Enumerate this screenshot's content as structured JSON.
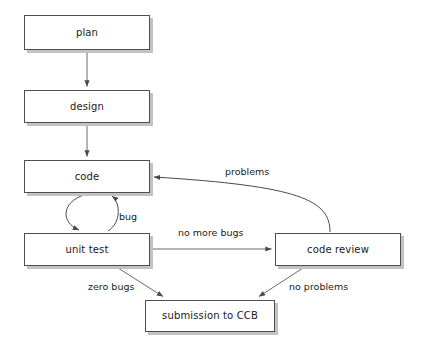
{
  "diagram": {
    "background_color": "#ffffff",
    "box_border_color": "#4f4f4f",
    "box_shadow_color": "#c2c2c2",
    "line_color": "#555555",
    "text_color": "#1a1a1a",
    "nodes": [
      {
        "id": "plan",
        "label": "plan",
        "x": 24,
        "y": 15,
        "w": 126,
        "h": 35
      },
      {
        "id": "design",
        "label": "design",
        "x": 24,
        "y": 90,
        "w": 126,
        "h": 33
      },
      {
        "id": "code",
        "label": "code",
        "x": 24,
        "y": 160,
        "w": 126,
        "h": 33
      },
      {
        "id": "unit_test",
        "label": "unit test",
        "x": 24,
        "y": 233,
        "w": 126,
        "h": 33
      },
      {
        "id": "code_review",
        "label": "code review",
        "x": 275,
        "y": 233,
        "w": 126,
        "h": 33
      },
      {
        "id": "submission",
        "label": "submission to CCB",
        "x": 145,
        "y": 300,
        "w": 130,
        "h": 32
      }
    ],
    "edges": [
      {
        "from": "plan",
        "to": "design",
        "label": ""
      },
      {
        "from": "design",
        "to": "code",
        "label": ""
      },
      {
        "from": "code",
        "to": "unit_test",
        "label": "bug",
        "style": "loop-left"
      },
      {
        "from": "unit_test",
        "to": "code",
        "label": "bug",
        "style": "loop-right"
      },
      {
        "from": "unit_test",
        "to": "code_review",
        "label": "no more bugs"
      },
      {
        "from": "code_review",
        "to": "code",
        "label": "problems",
        "style": "curved"
      },
      {
        "from": "unit_test",
        "to": "submission",
        "label": "zero bugs"
      },
      {
        "from": "code_review",
        "to": "submission",
        "label": "no problems"
      }
    ],
    "edge_labels": [
      {
        "id": "bug",
        "text": "bug",
        "x": 119,
        "y": 212
      },
      {
        "id": "problems",
        "text": "problems",
        "x": 225,
        "y": 167
      },
      {
        "id": "no_more_bugs",
        "text": "no more bugs",
        "x": 178,
        "y": 228
      },
      {
        "id": "zero_bugs",
        "text": "zero bugs",
        "x": 88,
        "y": 282
      },
      {
        "id": "no_problems",
        "text": "no problems",
        "x": 289,
        "y": 282
      }
    ]
  }
}
